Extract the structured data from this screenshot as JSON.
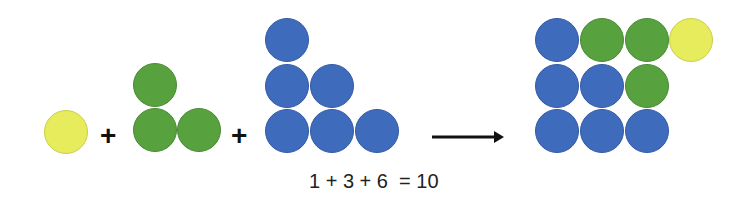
{
  "colors": {
    "yellow": "#e6ec5c",
    "yellow_border": "#c9cf4a",
    "green": "#57a13e",
    "green_border": "#4a8a35",
    "blue": "#3f6bbd",
    "blue_border": "#345aa3",
    "text": "#111111",
    "arrow": "#111111"
  },
  "dot_radius": 22,
  "groups": [
    {
      "name": "group-1-yellow",
      "count": 1,
      "dots": [
        {
          "x": 66,
          "y": 132,
          "color": "yellow"
        }
      ]
    },
    {
      "name": "group-3-green",
      "count": 3,
      "dots": [
        {
          "x": 155,
          "y": 85,
          "color": "green"
        },
        {
          "x": 155,
          "y": 130,
          "color": "green"
        },
        {
          "x": 199,
          "y": 130,
          "color": "green"
        }
      ]
    },
    {
      "name": "group-6-blue",
      "count": 6,
      "dots": [
        {
          "x": 287,
          "y": 40,
          "color": "blue"
        },
        {
          "x": 287,
          "y": 86,
          "color": "blue"
        },
        {
          "x": 332,
          "y": 86,
          "color": "blue"
        },
        {
          "x": 287,
          "y": 131,
          "color": "blue"
        },
        {
          "x": 332,
          "y": 131,
          "color": "blue"
        },
        {
          "x": 377,
          "y": 131,
          "color": "blue"
        }
      ]
    },
    {
      "name": "group-result-10",
      "count": 10,
      "dots": [
        {
          "x": 557,
          "y": 40,
          "color": "blue"
        },
        {
          "x": 602,
          "y": 40,
          "color": "green"
        },
        {
          "x": 647,
          "y": 40,
          "color": "green"
        },
        {
          "x": 691,
          "y": 40,
          "color": "yellow"
        },
        {
          "x": 557,
          "y": 86,
          "color": "blue"
        },
        {
          "x": 602,
          "y": 86,
          "color": "blue"
        },
        {
          "x": 647,
          "y": 86,
          "color": "green"
        },
        {
          "x": 557,
          "y": 131,
          "color": "blue"
        },
        {
          "x": 602,
          "y": 131,
          "color": "blue"
        },
        {
          "x": 647,
          "y": 131,
          "color": "blue"
        }
      ]
    }
  ],
  "operators": [
    {
      "symbol": "+",
      "x": 100,
      "y": 122
    },
    {
      "symbol": "+",
      "x": 231,
      "y": 122
    }
  ],
  "arrow": {
    "x1": 432,
    "x2": 503,
    "y": 137
  },
  "equation": "1 + 3 + 6  = 10"
}
